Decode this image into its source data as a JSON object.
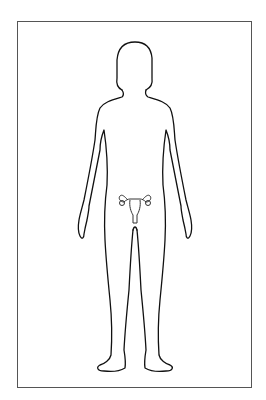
{
  "diagram": {
    "highlighted_organ": "uterus and ovaries",
    "colors": {
      "outline": "#111111",
      "frame": "#555555",
      "background": "#ffffff"
    }
  }
}
